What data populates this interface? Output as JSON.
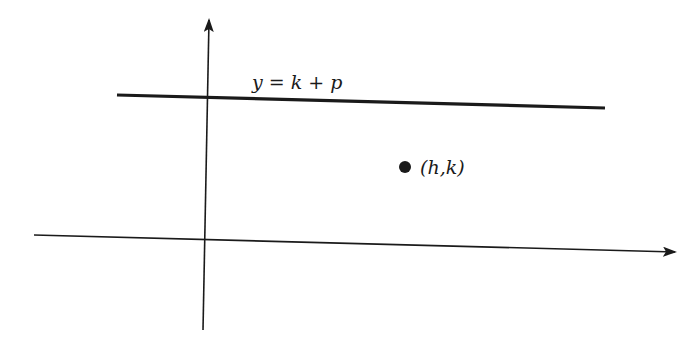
{
  "diagram": {
    "type": "coordinate-plane",
    "directrix": {
      "label": "y = k + p",
      "equation": "y = k + p"
    },
    "point": {
      "label": "(h,k)",
      "name": "vertex"
    },
    "axes": {
      "x_axis": "horizontal axis with arrow pointing right",
      "y_axis": "vertical axis with arrow pointing up"
    },
    "colors": {
      "ink": "#1a1a1a",
      "background": "#ffffff"
    }
  }
}
